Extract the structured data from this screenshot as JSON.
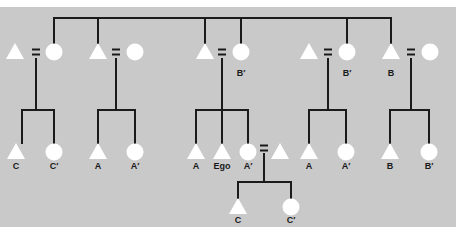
{
  "diagram": {
    "title": "",
    "type": "kinship-chart",
    "colors": {
      "background": "#ffffff",
      "panel": "#c9c9c9",
      "line": "#1a1a1a",
      "symbol": "#ffffff",
      "label": "#1a1a1a"
    },
    "legend_semantics": {
      "triangle": "male",
      "circle": "female",
      "equals": "marriage"
    },
    "sibling_bar": {
      "y": 18,
      "x1": 54,
      "x2": 391,
      "drops": [
        54,
        98,
        205,
        241,
        347,
        391
      ]
    },
    "generation1": [
      {
        "id": "g1-1",
        "husband": {
          "x": 15,
          "label": ""
        },
        "eq_x": 36,
        "wife": {
          "x": 54,
          "label": ""
        },
        "children_x": [
          22,
          54
        ],
        "child_bar_y": 110
      },
      {
        "id": "g1-2",
        "husband": {
          "x": 98,
          "label": ""
        },
        "eq_x": 116,
        "wife": {
          "x": 135,
          "label": ""
        },
        "children_x": [
          98,
          135
        ],
        "child_bar_y": 110
      },
      {
        "id": "g1-3",
        "husband": {
          "x": 205,
          "label": ""
        },
        "eq_x": 222,
        "wife": {
          "x": 241,
          "label": "B′"
        },
        "children_x": [
          196,
          222,
          248
        ],
        "child_bar_y": 110
      },
      {
        "id": "g1-4",
        "husband": {
          "x": 309,
          "label": ""
        },
        "eq_x": 328,
        "wife": {
          "x": 347,
          "label": "B′"
        },
        "children_x": [
          309,
          346
        ],
        "child_bar_y": 110
      },
      {
        "id": "g1-5",
        "husband": {
          "x": 391,
          "label": "B"
        },
        "eq_x": 411,
        "wife": {
          "x": 430,
          "label": ""
        },
        "children_x": [
          390,
          429
        ],
        "child_bar_y": 110
      }
    ],
    "generation2": [
      {
        "sex": "male",
        "x": 16,
        "label": "C"
      },
      {
        "sex": "female",
        "x": 54,
        "label": "C′"
      },
      {
        "sex": "male",
        "x": 98,
        "label": "A"
      },
      {
        "sex": "female",
        "x": 135,
        "label": "A′"
      },
      {
        "sex": "male",
        "x": 196,
        "label": "A"
      },
      {
        "sex": "male",
        "x": 222,
        "label": "Ego"
      },
      {
        "sex": "female",
        "x": 248,
        "label": "A′"
      },
      {
        "sex": "male",
        "x": 280,
        "label": ""
      },
      {
        "sex": "male",
        "x": 309,
        "label": "A"
      },
      {
        "sex": "female",
        "x": 346,
        "label": "A′"
      },
      {
        "sex": "male",
        "x": 390,
        "label": "B"
      },
      {
        "sex": "female",
        "x": 429,
        "label": "B′"
      }
    ],
    "gen2_marriage": {
      "eq_x": 264,
      "drop_x": 264,
      "child_bar_y": 182,
      "children_x": [
        238,
        291
      ]
    },
    "generation3": [
      {
        "sex": "male",
        "x": 238,
        "label": "C"
      },
      {
        "sex": "female",
        "x": 291,
        "label": "C′"
      }
    ]
  }
}
